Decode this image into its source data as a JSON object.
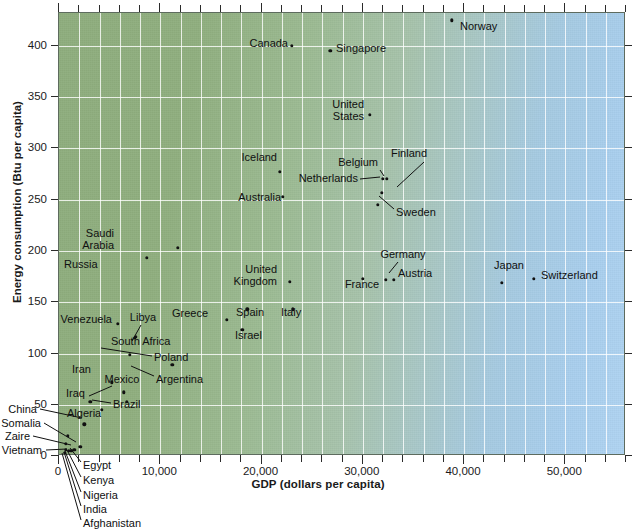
{
  "chart_data": {
    "type": "scatter",
    "title": "",
    "xlabel": "GDP (dollars per capita)",
    "ylabel": "Energy consumption (Btu per capita)",
    "xlim": [
      0,
      56000
    ],
    "ylim": [
      0,
      432
    ],
    "xticks": [
      0,
      10000,
      20000,
      30000,
      40000,
      50000
    ],
    "xticklabels": [
      "0",
      "10,000",
      "20,000",
      "30,000",
      "40,000",
      "50,000"
    ],
    "yticks": [
      0,
      50,
      100,
      150,
      200,
      250,
      300,
      350,
      400
    ],
    "yticklabels": [
      "0",
      "50",
      "100",
      "150",
      "200",
      "250",
      "300",
      "350",
      "400"
    ],
    "grid": true,
    "legend": "none",
    "points": [
      {
        "name": "Norway",
        "x": 38800,
        "y": 425,
        "lx": 460,
        "ly": 27,
        "anchor": "l",
        "leader": null
      },
      {
        "name": "Canada",
        "x": 23000,
        "y": 400,
        "lx": 288,
        "ly": 44,
        "anchor": "r",
        "leader": null
      },
      {
        "name": "Singapore",
        "x": 26800,
        "y": 395,
        "lx": 336,
        "ly": 49,
        "anchor": "l",
        "leader": null
      },
      {
        "name": "United\nStates",
        "x": 30700,
        "y": 333,
        "lx": 364,
        "ly": 111,
        "anchor": "r",
        "leader": null
      },
      {
        "name": "Iceland",
        "x": 21800,
        "y": 277,
        "lx": 277,
        "ly": 158,
        "anchor": "r",
        "leader": null
      },
      {
        "name": "Finland",
        "x": 31900,
        "y": 257,
        "lx": 427,
        "ly": 154,
        "anchor": "r",
        "leader": "finland"
      },
      {
        "name": "Belgium",
        "x": 32000,
        "y": 270,
        "lx": 378,
        "ly": 163,
        "anchor": "r",
        "leader": "belgium"
      },
      {
        "name": "Netherlands",
        "x": 32000,
        "y": 270,
        "lx": 358,
        "ly": 179,
        "anchor": "r",
        "leader": "netherlands"
      },
      {
        "name": "Australia",
        "x": 22100,
        "y": 253,
        "lx": 281,
        "ly": 198,
        "anchor": "r",
        "leader": null
      },
      {
        "name": "Sweden",
        "x": 31500,
        "y": 245,
        "lx": 396,
        "ly": 213,
        "anchor": "l",
        "leader": "sweden"
      },
      {
        "name": "Saudi\nArabia",
        "x": 11700,
        "y": 203,
        "lx": 114,
        "ly": 240,
        "anchor": "r",
        "leader": null
      },
      {
        "name": "Russia",
        "x": 8700,
        "y": 193,
        "lx": 64,
        "ly": 265,
        "anchor": "l",
        "leader": null
      },
      {
        "name": "Germany",
        "x": 32300,
        "y": 172,
        "lx": 403,
        "ly": 255,
        "anchor": "c",
        "leader": "germany"
      },
      {
        "name": "Austria",
        "x": 33100,
        "y": 172,
        "lx": 398,
        "ly": 274,
        "anchor": "l",
        "leader": null
      },
      {
        "name": "Japan",
        "x": 43700,
        "y": 169,
        "lx": 509,
        "ly": 266,
        "anchor": "c",
        "leader": null
      },
      {
        "name": "Switzerland",
        "x": 46900,
        "y": 173,
        "lx": 541,
        "ly": 276,
        "anchor": "l",
        "leader": null
      },
      {
        "name": "France",
        "x": 30000,
        "y": 173,
        "lx": 362,
        "ly": 285,
        "anchor": "c",
        "leader": null
      },
      {
        "name": "United\nKingdom",
        "x": 22800,
        "y": 170,
        "lx": 277,
        "ly": 276,
        "anchor": "r",
        "leader": null
      },
      {
        "name": "Italy",
        "x": 23100,
        "y": 143,
        "lx": 281,
        "ly": 313,
        "anchor": "l",
        "leader": null
      },
      {
        "name": "Spain",
        "x": 18600,
        "y": 143,
        "lx": 236,
        "ly": 313,
        "anchor": "l",
        "leader": null
      },
      {
        "name": "Greece",
        "x": 16600,
        "y": 133,
        "lx": 190,
        "ly": 314,
        "anchor": "c",
        "leader": null
      },
      {
        "name": "Venezuela",
        "x": 5800,
        "y": 129,
        "lx": 112,
        "ly": 320,
        "anchor": "r",
        "leader": null
      },
      {
        "name": "Israel",
        "x": 18100,
        "y": 123,
        "lx": 235,
        "ly": 336,
        "anchor": "l",
        "leader": null
      },
      {
        "name": "Libya",
        "x": 7600,
        "y": 116,
        "lx": 143,
        "ly": 318,
        "anchor": "c",
        "leader": "libya"
      },
      {
        "name": "South Africa",
        "x": 7500,
        "y": 115,
        "lx": 111,
        "ly": 342,
        "anchor": "l",
        "leader": null
      },
      {
        "name": "Poland",
        "x": 7000,
        "y": 99,
        "lx": 154,
        "ly": 358,
        "anchor": "l",
        "leader": "poland"
      },
      {
        "name": "Argentina",
        "x": 11200,
        "y": 89,
        "lx": 156,
        "ly": 380,
        "anchor": "l",
        "leader": "argentina"
      },
      {
        "name": "Iran",
        "x": 5200,
        "y": 72,
        "lx": 72,
        "ly": 370,
        "anchor": "l",
        "leader": null
      },
      {
        "name": "Mexico",
        "x": 6400,
        "y": 62,
        "lx": 122,
        "ly": 380,
        "anchor": "c",
        "leader": "mexico"
      },
      {
        "name": "Brazil",
        "x": 6700,
        "y": 53,
        "lx": 113,
        "ly": 405,
        "anchor": "l",
        "leader": "brazil"
      },
      {
        "name": "Iraq",
        "x": 3100,
        "y": 53,
        "lx": 66,
        "ly": 394,
        "anchor": "l",
        "leader": null
      },
      {
        "name": "Algeria",
        "x": 4200,
        "y": 45,
        "lx": 67,
        "ly": 414,
        "anchor": "l",
        "leader": null
      },
      {
        "name": "China",
        "x": 2500,
        "y": 31,
        "lx": 37,
        "ly": 410,
        "anchor": "r",
        "leader": "china"
      },
      {
        "name": "Somalia",
        "x": 900,
        "y": 20,
        "lx": 41,
        "ly": 424,
        "anchor": "r",
        "leader": "somalia"
      },
      {
        "name": "Zaire",
        "x": 700,
        "y": 12,
        "lx": 30,
        "ly": 437,
        "anchor": "r",
        "leader": "zaire"
      },
      {
        "name": "Vietnam",
        "x": 700,
        "y": 6,
        "lx": 42,
        "ly": 451,
        "anchor": "r",
        "leader": "vietnam"
      },
      {
        "name": "Egypt",
        "x": 2100,
        "y": 9,
        "lx": 83,
        "ly": 466,
        "anchor": "l",
        "leader": "egypt"
      },
      {
        "name": "Kenya",
        "x": 1500,
        "y": 6,
        "lx": 83,
        "ly": 481,
        "anchor": "l",
        "leader": "kenya"
      },
      {
        "name": "Nigeria",
        "x": 1200,
        "y": 5,
        "lx": 83,
        "ly": 496,
        "anchor": "l",
        "leader": "nigeria"
      },
      {
        "name": "India",
        "x": 1000,
        "y": 5,
        "lx": 83,
        "ly": 510,
        "anchor": "l",
        "leader": "india"
      },
      {
        "name": "Afghanistan",
        "x": 600,
        "y": 3,
        "lx": 83,
        "ly": 524,
        "anchor": "l",
        "leader": "afghanistan"
      }
    ],
    "leaders": [
      {
        "id": "finland",
        "x1": 424,
        "y1": 162,
        "x2": 397,
        "y2": 187
      },
      {
        "id": "belgium",
        "x1": 380,
        "y1": 170,
        "x2": 384,
        "y2": 176
      },
      {
        "id": "netherlands",
        "x1": 360,
        "y1": 179,
        "x2": 380,
        "y2": 177
      },
      {
        "id": "sweden",
        "x1": 394,
        "y1": 209,
        "x2": 379,
        "y2": 196
      },
      {
        "id": "germany",
        "x1": 398,
        "y1": 262,
        "x2": 389,
        "y2": 273
      },
      {
        "id": "libya",
        "x1": 141,
        "y1": 325,
        "x2": 132,
        "y2": 341
      },
      {
        "id": "poland",
        "x1": 152,
        "y1": 356,
        "x2": 101,
        "y2": 348
      },
      {
        "id": "argentina",
        "x1": 154,
        "y1": 376,
        "x2": 131,
        "y2": 366
      },
      {
        "id": "mexico",
        "x1": 112,
        "y1": 386,
        "x2": 89,
        "y2": 396
      },
      {
        "id": "brazil",
        "x1": 111,
        "y1": 403,
        "x2": 92,
        "y2": 400
      },
      {
        "id": "china",
        "x1": 40,
        "y1": 409,
        "x2": 82,
        "y2": 418
      },
      {
        "id": "somalia",
        "x1": 44,
        "y1": 423,
        "x2": 76,
        "y2": 442
      },
      {
        "id": "zaire",
        "x1": 33,
        "y1": 436,
        "x2": 71,
        "y2": 445
      },
      {
        "id": "vietnam",
        "x1": 46,
        "y1": 450,
        "x2": 67,
        "y2": 449
      },
      {
        "id": "egypt",
        "x1": 81,
        "y1": 462,
        "x2": 70,
        "y2": 448
      },
      {
        "id": "kenya",
        "x1": 81,
        "y1": 477,
        "x2": 67,
        "y2": 450
      },
      {
        "id": "nigeria",
        "x1": 81,
        "y1": 492,
        "x2": 65,
        "y2": 451
      },
      {
        "id": "india",
        "x1": 81,
        "y1": 506,
        "x2": 64,
        "y2": 452
      },
      {
        "id": "afghanistan",
        "x1": 81,
        "y1": 520,
        "x2": 62,
        "y2": 453
      }
    ]
  }
}
